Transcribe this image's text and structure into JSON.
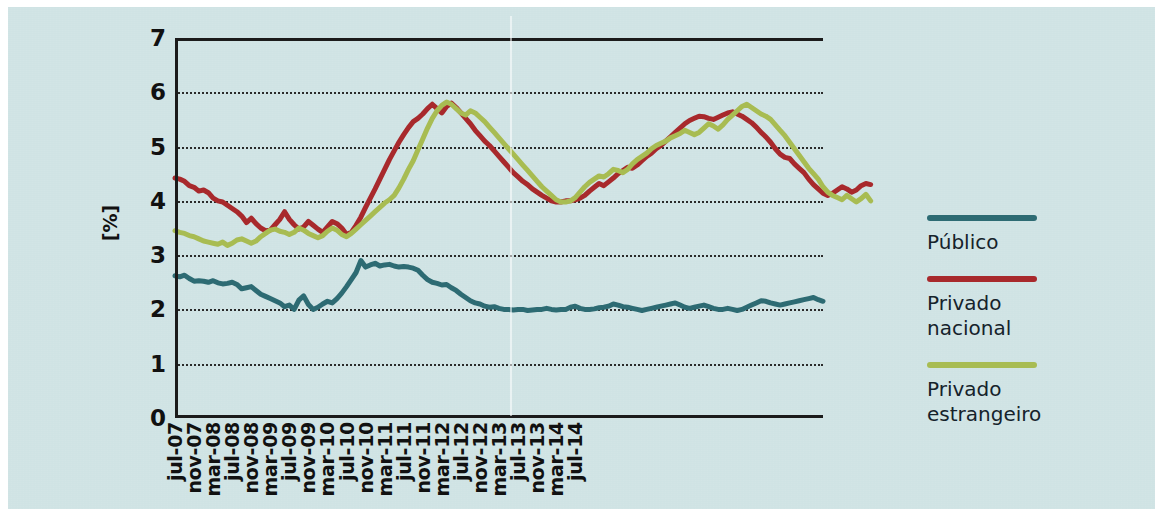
{
  "figure": {
    "background_color": "#cfe3e4",
    "axis_color": "#1b1b1b"
  },
  "chart_data": {
    "type": "line",
    "title": "",
    "xlabel": "",
    "ylabel": "[%]",
    "ylim": [
      0,
      7
    ],
    "yticks": [
      0,
      1,
      2,
      3,
      4,
      5,
      6,
      7
    ],
    "grid": "horizontal-dotted",
    "legend_position": "right",
    "x_tick_labels": [
      "jul-07",
      "nov-07",
      "mar-08",
      "jul-08",
      "nov-08",
      "mar-09",
      "jul-09",
      "nov-09",
      "mar-10",
      "jul-10",
      "nov-10",
      "mar-11",
      "jul-11",
      "nov-11",
      "mar-12",
      "jul-12",
      "nov-12",
      "mar-13",
      "jul-13",
      "nov-13",
      "mar-14",
      "jul-14"
    ],
    "x_start": "jul-07",
    "x_end": "jul-14",
    "x_step_months": 1,
    "series": [
      {
        "name": "Público",
        "color": "#2d6b73",
        "values": [
          2.62,
          2.6,
          2.63,
          2.57,
          2.52,
          2.53,
          2.52,
          2.5,
          2.53,
          2.49,
          2.47,
          2.48,
          2.5,
          2.46,
          2.38,
          2.4,
          2.42,
          2.35,
          2.28,
          2.24,
          2.2,
          2.16,
          2.12,
          2.05,
          2.08,
          2.0,
          2.17,
          2.25,
          2.09,
          2.0,
          2.04,
          2.1,
          2.15,
          2.12,
          2.2,
          2.3,
          2.42,
          2.55,
          2.68,
          2.9,
          2.78,
          2.82,
          2.85,
          2.8,
          2.82,
          2.83,
          2.8,
          2.78,
          2.79,
          2.78,
          2.76,
          2.72,
          2.63,
          2.55,
          2.5,
          2.48,
          2.45,
          2.46,
          2.4,
          2.35,
          2.28,
          2.22,
          2.16,
          2.12,
          2.1,
          2.06,
          2.04,
          2.05,
          2.02,
          2.0,
          2.0,
          1.99,
          2.0,
          2.0,
          1.98,
          1.99,
          2.0,
          2.0,
          2.02,
          2.0,
          1.99,
          2.0,
          2.0,
          2.04,
          2.06,
          2.02,
          2.0,
          2.0,
          2.01,
          2.03,
          2.04,
          2.06,
          2.1,
          2.08,
          2.05,
          2.04,
          2.02,
          2.0,
          1.98,
          2.0,
          2.02,
          2.04,
          2.06,
          2.08,
          2.1,
          2.12,
          2.08,
          2.04,
          2.02,
          2.04,
          2.06,
          2.08,
          2.05,
          2.02,
          2.0,
          2.0,
          2.02,
          2.0,
          1.98,
          2.0,
          2.04,
          2.08,
          2.12,
          2.16,
          2.15,
          2.12,
          2.1,
          2.08,
          2.1,
          2.12,
          2.14,
          2.16,
          2.18,
          2.2,
          2.22,
          2.18,
          2.15
        ]
      },
      {
        "name": "Privado nacional",
        "color": "#a8292c",
        "values": [
          4.42,
          4.4,
          4.36,
          4.28,
          4.25,
          4.18,
          4.2,
          4.15,
          4.05,
          4.0,
          3.98,
          3.92,
          3.86,
          3.8,
          3.72,
          3.6,
          3.68,
          3.58,
          3.5,
          3.45,
          3.46,
          3.56,
          3.66,
          3.8,
          3.66,
          3.56,
          3.48,
          3.52,
          3.62,
          3.55,
          3.48,
          3.42,
          3.52,
          3.62,
          3.58,
          3.5,
          3.38,
          3.42,
          3.55,
          3.7,
          3.88,
          4.05,
          4.22,
          4.4,
          4.58,
          4.76,
          4.92,
          5.08,
          5.22,
          5.35,
          5.46,
          5.52,
          5.6,
          5.7,
          5.78,
          5.7,
          5.62,
          5.74,
          5.8,
          5.72,
          5.62,
          5.52,
          5.42,
          5.3,
          5.2,
          5.1,
          5.02,
          4.92,
          4.82,
          4.72,
          4.62,
          4.52,
          4.44,
          4.36,
          4.3,
          4.22,
          4.16,
          4.1,
          4.05,
          4.0,
          3.98,
          3.98,
          4.0,
          4.0,
          4.02,
          4.05,
          4.1,
          4.18,
          4.25,
          4.32,
          4.28,
          4.35,
          4.42,
          4.5,
          4.56,
          4.62,
          4.6,
          4.66,
          4.74,
          4.82,
          4.88,
          4.96,
          5.02,
          5.1,
          5.18,
          5.26,
          5.34,
          5.42,
          5.48,
          5.52,
          5.56,
          5.55,
          5.52,
          5.5,
          5.54,
          5.58,
          5.62,
          5.64,
          5.6,
          5.56,
          5.5,
          5.44,
          5.36,
          5.26,
          5.18,
          5.08,
          4.96,
          4.86,
          4.8,
          4.78,
          4.68,
          4.6,
          4.52,
          4.4,
          4.3,
          4.22,
          4.14,
          4.1,
          4.14,
          4.2,
          4.26,
          4.22,
          4.16,
          4.2,
          4.28,
          4.32,
          4.3
        ]
      },
      {
        "name": "Privado estrangeiro",
        "color": "#a8bc52",
        "values": [
          3.45,
          3.42,
          3.4,
          3.36,
          3.34,
          3.3,
          3.26,
          3.24,
          3.22,
          3.2,
          3.24,
          3.18,
          3.22,
          3.28,
          3.3,
          3.26,
          3.22,
          3.26,
          3.34,
          3.4,
          3.46,
          3.48,
          3.44,
          3.42,
          3.38,
          3.42,
          3.5,
          3.46,
          3.4,
          3.36,
          3.32,
          3.36,
          3.44,
          3.5,
          3.46,
          3.38,
          3.34,
          3.4,
          3.48,
          3.56,
          3.64,
          3.72,
          3.8,
          3.88,
          3.96,
          4.02,
          4.1,
          4.24,
          4.4,
          4.58,
          4.74,
          4.94,
          5.14,
          5.34,
          5.52,
          5.66,
          5.76,
          5.82,
          5.78,
          5.7,
          5.62,
          5.58,
          5.66,
          5.62,
          5.54,
          5.46,
          5.36,
          5.26,
          5.16,
          5.06,
          4.96,
          4.86,
          4.76,
          4.66,
          4.56,
          4.46,
          4.36,
          4.26,
          4.18,
          4.1,
          4.02,
          3.98,
          3.98,
          4.0,
          4.06,
          4.16,
          4.26,
          4.34,
          4.4,
          4.46,
          4.44,
          4.5,
          4.58,
          4.56,
          4.52,
          4.58,
          4.68,
          4.76,
          4.82,
          4.88,
          4.96,
          5.02,
          5.06,
          5.1,
          5.16,
          5.2,
          5.24,
          5.3,
          5.26,
          5.22,
          5.26,
          5.34,
          5.42,
          5.38,
          5.32,
          5.4,
          5.5,
          5.58,
          5.66,
          5.74,
          5.78,
          5.72,
          5.66,
          5.6,
          5.56,
          5.5,
          5.4,
          5.3,
          5.2,
          5.08,
          4.96,
          4.84,
          4.72,
          4.6,
          4.5,
          4.4,
          4.26,
          4.16,
          4.1,
          4.06,
          4.02,
          4.1,
          4.04,
          3.98,
          4.04,
          4.12,
          4.0
        ]
      }
    ]
  },
  "legend": {
    "entries": [
      {
        "label": "Público",
        "color": "#2d6b73"
      },
      {
        "label": "Privado\nnacional",
        "color": "#a8292c"
      },
      {
        "label": "Privado\nestrangeiro",
        "color": "#a8bc52"
      }
    ]
  }
}
